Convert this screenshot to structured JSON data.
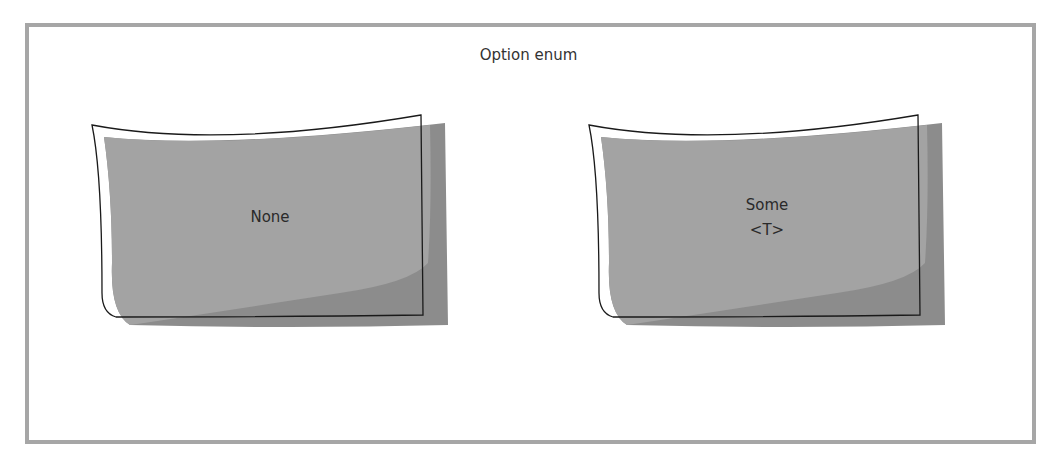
{
  "diagram": {
    "title": "Option enum",
    "variants": [
      {
        "name": "None",
        "lines": [
          "None"
        ]
      },
      {
        "name": "Some",
        "lines": [
          "Some",
          "<T>"
        ]
      }
    ],
    "colors": {
      "frame": "#a6a6a6",
      "card_fill": "#a3a3a3",
      "card_shadow": "#8c8c8c",
      "card_outline": "#1a1a1a",
      "text": "#333333"
    }
  }
}
